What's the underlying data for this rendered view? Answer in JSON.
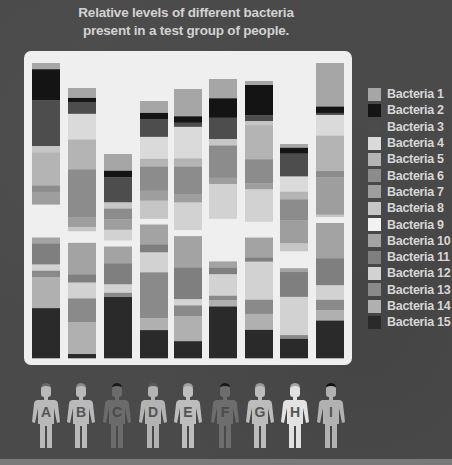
{
  "chart_data": {
    "type": "bar",
    "stacked": true,
    "xlabel": "",
    "ylabel": "",
    "legend_position": "right",
    "categories": [
      "A",
      "B",
      "C",
      "D",
      "E",
      "F",
      "G",
      "H",
      "I"
    ],
    "legend": [
      {
        "name": "Bacteria 1",
        "color": "#a6a6a6"
      },
      {
        "name": "Bacteria 2",
        "color": "#141414"
      },
      {
        "name": "Bacteria 3",
        "color": "#4d4d4d"
      },
      {
        "name": "Bacteria 4",
        "color": "#dadada"
      },
      {
        "name": "Bacteria 5",
        "color": "#b4b4b4"
      },
      {
        "name": "Bacteria 6",
        "color": "#8c8c8c"
      },
      {
        "name": "Bacteria 7",
        "color": "#9e9e9e"
      },
      {
        "name": "Bacteria 8",
        "color": "#c6c6c6"
      },
      {
        "name": "Bacteria 9",
        "color": "#f2f2f2"
      },
      {
        "name": "Bacteria 10",
        "color": "#a3a3a3"
      },
      {
        "name": "Bacteria 11",
        "color": "#7f7f7f"
      },
      {
        "name": "Bacteria 12",
        "color": "#d2d2d2"
      },
      {
        "name": "Bacteria 13",
        "color": "#8a8a8a"
      },
      {
        "name": "Bacteria 14",
        "color": "#b0b0b0"
      },
      {
        "name": "Bacteria 15",
        "color": "#2a2a2a"
      }
    ],
    "stacks": [
      {
        "person": "A",
        "top_offset": 4,
        "upper": [
          [
            1,
            3
          ],
          [
            2,
            15
          ],
          [
            3,
            22
          ],
          [
            8,
            3
          ],
          [
            5,
            16
          ],
          [
            6,
            3
          ],
          [
            7,
            6
          ]
        ],
        "gap": 16,
        "lower": [
          [
            10,
            3
          ],
          [
            11,
            10
          ],
          [
            12,
            3
          ],
          [
            13,
            3
          ],
          [
            14,
            15
          ],
          [
            15,
            24
          ]
        ]
      },
      {
        "person": "B",
        "top_offset": 29,
        "upper": [
          [
            1,
            5
          ],
          [
            2,
            2
          ],
          [
            3,
            6
          ],
          [
            4,
            13
          ],
          [
            5,
            15
          ],
          [
            6,
            24
          ],
          [
            7,
            5
          ],
          [
            8,
            2
          ]
        ],
        "gap": 6,
        "lower": [
          [
            10,
            16
          ],
          [
            11,
            4
          ],
          [
            12,
            8
          ],
          [
            13,
            12
          ],
          [
            14,
            16
          ],
          [
            15,
            2
          ]
        ]
      },
      {
        "person": "C",
        "top_offset": 95,
        "upper": [
          [
            1,
            8
          ],
          [
            2,
            3
          ],
          [
            3,
            12
          ],
          [
            8,
            3
          ],
          [
            6,
            5
          ],
          [
            7,
            5
          ],
          [
            12,
            5
          ]
        ],
        "gap": 3,
        "lower": [
          [
            10,
            8
          ],
          [
            11,
            10
          ],
          [
            12,
            4
          ],
          [
            13,
            2
          ],
          [
            15,
            29
          ]
        ]
      },
      {
        "person": "D",
        "top_offset": 42,
        "upper": [
          [
            1,
            6
          ],
          [
            2,
            3
          ],
          [
            3,
            9
          ],
          [
            4,
            11
          ],
          [
            5,
            4
          ],
          [
            6,
            12
          ],
          [
            7,
            5
          ],
          [
            8,
            9
          ]
        ],
        "gap": 3,
        "lower": [
          [
            10,
            10
          ],
          [
            11,
            4
          ],
          [
            12,
            10
          ],
          [
            13,
            23
          ],
          [
            14,
            6
          ],
          [
            15,
            14
          ]
        ]
      },
      {
        "person": "E",
        "top_offset": 30,
        "upper": [
          [
            1,
            13
          ],
          [
            2,
            3
          ],
          [
            3,
            2
          ],
          [
            4,
            15
          ],
          [
            5,
            4
          ],
          [
            6,
            13
          ],
          [
            7,
            4
          ],
          [
            12,
            13
          ]
        ],
        "gap": 3,
        "lower": [
          [
            10,
            15
          ],
          [
            11,
            15
          ],
          [
            12,
            3
          ],
          [
            13,
            5
          ],
          [
            14,
            12
          ],
          [
            15,
            8
          ]
        ]
      },
      {
        "person": "F",
        "top_offset": 20,
        "upper": [
          [
            1,
            9
          ],
          [
            2,
            9
          ],
          [
            3,
            10
          ],
          [
            8,
            3
          ],
          [
            6,
            15
          ],
          [
            7,
            3
          ],
          [
            12,
            16
          ]
        ],
        "gap": 20,
        "lower": [
          [
            10,
            3
          ],
          [
            11,
            3
          ],
          [
            12,
            10
          ],
          [
            13,
            2
          ],
          [
            14,
            3
          ],
          [
            15,
            24
          ]
        ]
      },
      {
        "person": "G",
        "top_offset": 22,
        "upper": [
          [
            1,
            2
          ],
          [
            2,
            15
          ],
          [
            3,
            3
          ],
          [
            8,
            2
          ],
          [
            5,
            17
          ],
          [
            6,
            12
          ],
          [
            7,
            3
          ],
          [
            12,
            16
          ]
        ],
        "gap": 8,
        "lower": [
          [
            10,
            10
          ],
          [
            11,
            2
          ],
          [
            12,
            19
          ],
          [
            13,
            7
          ],
          [
            14,
            8
          ],
          [
            15,
            14
          ]
        ]
      },
      {
        "person": "H",
        "top_offset": 85,
        "upper": [
          [
            1,
            2
          ],
          [
            2,
            3
          ],
          [
            3,
            12
          ],
          [
            4,
            8
          ],
          [
            5,
            4
          ],
          [
            6,
            11
          ],
          [
            7,
            12
          ],
          [
            8,
            4
          ]
        ],
        "gap": 9,
        "lower": [
          [
            10,
            2
          ],
          [
            11,
            13
          ],
          [
            12,
            20
          ],
          [
            13,
            2
          ],
          [
            15,
            10
          ]
        ]
      },
      {
        "person": "I",
        "top_offset": 4,
        "upper": [
          [
            1,
            21
          ],
          [
            2,
            3
          ],
          [
            3,
            1
          ],
          [
            4,
            10
          ],
          [
            5,
            17
          ],
          [
            6,
            3
          ],
          [
            7,
            18
          ],
          [
            8,
            1
          ]
        ],
        "gap": 3,
        "lower": [
          [
            10,
            17
          ],
          [
            11,
            13
          ],
          [
            12,
            7
          ],
          [
            13,
            5
          ],
          [
            14,
            5
          ],
          [
            15,
            18
          ]
        ]
      }
    ]
  },
  "people": [
    {
      "letter": "A",
      "shade": "#b9b9b9",
      "hair": "#6a6a6a"
    },
    {
      "letter": "B",
      "shade": "#b9b9b9",
      "hair": "#8a8a8a"
    },
    {
      "letter": "C",
      "shade": "#6b6b6b",
      "hair": "#1a1a1a"
    },
    {
      "letter": "D",
      "shade": "#b3b3b3",
      "hair": "#5a5a5a"
    },
    {
      "letter": "E",
      "shade": "#bdbdbd",
      "hair": "#a0a0a0"
    },
    {
      "letter": "F",
      "shade": "#6d6d6d",
      "hair": "#1a1a1a"
    },
    {
      "letter": "G",
      "shade": "#bcbcbc",
      "hair": "#9a9a9a"
    },
    {
      "letter": "H",
      "shade": "#e2e2e2",
      "hair": "#a8a8a8"
    },
    {
      "letter": "I",
      "shade": "#b1b1b1",
      "hair": "#111111"
    }
  ]
}
